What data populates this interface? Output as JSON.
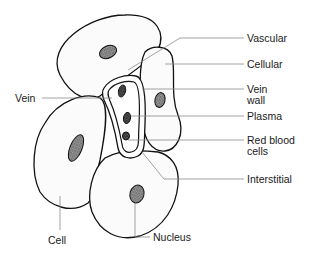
{
  "diagram": {
    "title": "",
    "labels": {
      "vascular": "Vascular",
      "cellular": "Cellular",
      "vein_wall_line1": "Vein",
      "vein_wall_line2": "wall",
      "plasma": "Plasma",
      "red_blood_cells_line1": "Red blood",
      "red_blood_cells_line2": "cells",
      "interstitial": "Interstitial",
      "vein": "Vein",
      "cell": "Cell",
      "nucleus": "Nucleus"
    },
    "colors": {
      "outline": "#111111",
      "leader": "#8a8a8a",
      "text": "#1a1a1a",
      "background": "#ffffff"
    }
  }
}
